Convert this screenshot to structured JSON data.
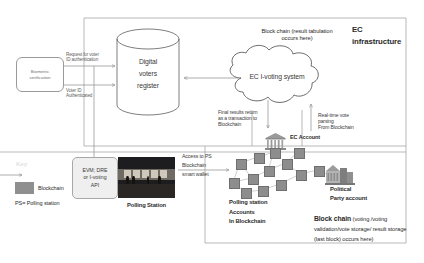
{
  "diagram": {
    "regions": {
      "ec_infrastructure": "EC\ninfrastructure",
      "ec_infrastructure_line1": "EC",
      "ec_infrastructure_line2": "infrastructure",
      "blockchain_region_bold": "Block chain",
      "blockchain_region_rest": "(voting /voting validation/vote storage/ result storage (last block) occurs here)"
    },
    "nodes": {
      "biometric": "Biometric verification",
      "biometric_line1": "Biometric",
      "biometric_line2": "verification",
      "voters_register_line1": "Digital",
      "voters_register_line2": "voters",
      "voters_register_line3": "register",
      "ec_ivoting_system": "EC I-voting system",
      "evm_line1": "EVM; DRE",
      "evm_line2": "or I-voting",
      "evm_line3": "API",
      "polling_station_photo_caption": "Polling  Station",
      "ec_account": "EC Account",
      "political_party_line1": "Political",
      "political_party_line2": "Party account",
      "polling_station_accounts_line1": "Polling station",
      "polling_station_accounts_line2": "Accounts",
      "polling_station_accounts_line3": "In Blockchain"
    },
    "edge_labels": {
      "request_auth_line1": "Request for voter",
      "request_auth_line2": "ID authentication",
      "voter_authenticated_line1": "Voter ID",
      "voter_authenticated_line2": "Authenticated",
      "blockchain_tabulation_line1": "Block chain (result tabulation",
      "blockchain_tabulation_line2": "occurs here)",
      "final_results_line1": "Final results return",
      "final_results_line2": "as a transaction to",
      "final_results_line3": "Blockchain",
      "realtime_parsing_line1": "Real-time vote",
      "realtime_parsing_line2": "parsing",
      "realtime_parsing_line3": "From Blockchain",
      "access_ps_line1": "Access to  PS",
      "access_ps_line2": "Blockchain",
      "access_ps_line3": "smart wallet"
    },
    "legend": {
      "title": "Key",
      "swatch_label": "Blockchain",
      "abbreviation": "PS= Polling station",
      "swatch_color": "#8f8f8f"
    }
  }
}
